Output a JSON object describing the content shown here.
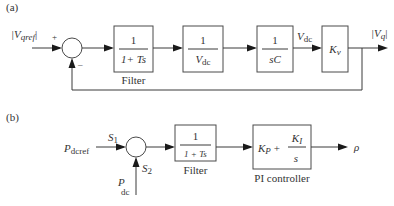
{
  "diagram_a": {
    "panel_label": "(a)",
    "input_label": {
      "pre": "|V",
      "sub": "qref",
      "post": "|"
    },
    "sum_signs": {
      "plus": "+",
      "minus": "–"
    },
    "blocks": [
      {
        "id": "filter",
        "numerator": "1",
        "denominator": "1+ Ts",
        "caption": "Filter"
      },
      {
        "id": "inv-vdc",
        "numerator": "1",
        "denominator_main": "V",
        "denominator_sub": "dc"
      },
      {
        "id": "integrator",
        "numerator": "1",
        "denominator": "sC"
      },
      {
        "id": "gain",
        "main": "K",
        "sub": "v"
      }
    ],
    "signal_vdc": {
      "main": "V",
      "sub": "dc"
    },
    "output_label": {
      "pre": "|V",
      "sub": "q",
      "post": "|"
    }
  },
  "diagram_b": {
    "panel_label": "(b)",
    "input_label": {
      "main": "P",
      "sub": "dcref"
    },
    "feedback_label": {
      "main": "P",
      "sub": "dc"
    },
    "s1": {
      "main": "S",
      "sub": "1"
    },
    "s2": {
      "main": "S",
      "sub": "2"
    },
    "blocks": [
      {
        "id": "filter",
        "numerator": "1",
        "denominator": "1 + Ts",
        "caption": "Filter"
      },
      {
        "id": "pi",
        "kp_main": "K",
        "kp_sub": "P",
        "plus": "+",
        "ki_main": "K",
        "ki_sub": "I",
        "ki_den": "s",
        "caption": "PI controller"
      }
    ],
    "output_label": "ρ"
  }
}
